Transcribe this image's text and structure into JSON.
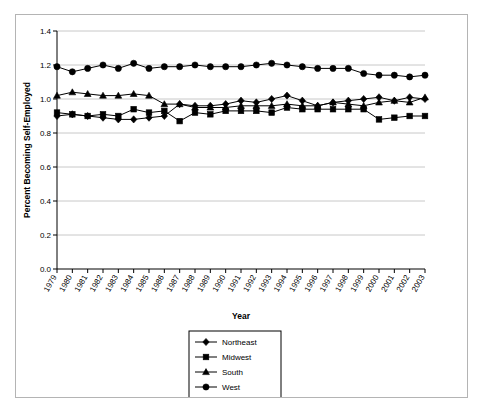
{
  "chart_data": {
    "type": "line",
    "title": "",
    "xlabel": "Year",
    "ylabel": "Percent Becoming Self-Employed",
    "ylim": [
      0.0,
      1.4
    ],
    "ytick_step": 0.2,
    "yticks": [
      "0.0",
      "0.2",
      "0.4",
      "0.6",
      "0.8",
      "1.0",
      "1.2",
      "1.4"
    ],
    "grid": true,
    "grid_axis": "y",
    "legend_position": "bottom-center",
    "categories": [
      "1979",
      "1980",
      "1981",
      "1982",
      "1983",
      "1984",
      "1985",
      "1986",
      "1987",
      "1988",
      "1989",
      "1990",
      "1991",
      "1992",
      "1993",
      "1994",
      "1995",
      "1996",
      "1997",
      "1998",
      "1999",
      "2000",
      "2001",
      "2002",
      "2003"
    ],
    "series": [
      {
        "name": "Northeast",
        "marker": "diamond",
        "values": [
          0.9,
          0.91,
          0.9,
          0.89,
          0.88,
          0.88,
          0.89,
          0.9,
          0.97,
          0.96,
          0.96,
          0.97,
          0.99,
          0.98,
          1.0,
          1.02,
          0.99,
          0.96,
          0.98,
          0.99,
          1.0,
          1.01,
          0.99,
          1.01,
          1.0
        ]
      },
      {
        "name": "Midwest",
        "marker": "square",
        "values": [
          0.92,
          0.91,
          0.9,
          0.91,
          0.9,
          0.94,
          0.92,
          0.93,
          0.87,
          0.92,
          0.91,
          0.93,
          0.93,
          0.93,
          0.92,
          0.95,
          0.94,
          0.94,
          0.94,
          0.94,
          0.94,
          0.88,
          0.89,
          0.9,
          0.9
        ]
      },
      {
        "name": "South",
        "marker": "triangle",
        "values": [
          1.02,
          1.04,
          1.03,
          1.02,
          1.02,
          1.03,
          1.02,
          0.97,
          0.97,
          0.95,
          0.95,
          0.95,
          0.96,
          0.96,
          0.96,
          0.97,
          0.96,
          0.96,
          0.98,
          0.97,
          0.96,
          0.98,
          0.99,
          0.98,
          1.01
        ]
      },
      {
        "name": "West",
        "marker": "circle",
        "values": [
          1.19,
          1.16,
          1.18,
          1.2,
          1.18,
          1.21,
          1.18,
          1.19,
          1.19,
          1.2,
          1.19,
          1.19,
          1.19,
          1.2,
          1.21,
          1.2,
          1.19,
          1.18,
          1.18,
          1.18,
          1.15,
          1.14,
          1.14,
          1.13,
          1.14
        ]
      }
    ],
    "legend": [
      "Northeast",
      "Midwest",
      "South",
      "West"
    ]
  }
}
